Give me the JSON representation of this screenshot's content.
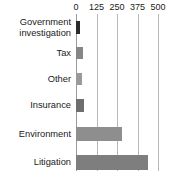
{
  "chart_data": {
    "type": "bar",
    "orientation": "horizontal",
    "title": "",
    "subtitle": "",
    "xlabel": "",
    "ylabel": "",
    "categories": [
      "Government\ninvestigation",
      "Tax",
      "Other",
      "Insurance",
      "Environment",
      "Litigation"
    ],
    "values": [
      25,
      42,
      38,
      48,
      280,
      442
    ],
    "xlim": [
      0,
      500
    ],
    "xticks": [
      0,
      125,
      250,
      375,
      500
    ],
    "xtick_labels": [
      "0",
      "125",
      "250",
      "375",
      "500"
    ],
    "grid": true,
    "grid_axis": "x",
    "legend": false,
    "bar_colors": [
      "#2b2b2b",
      "#868686",
      "#9a9a9a",
      "#6e6e6e",
      "#8e8e8e",
      "#7e7e7e"
    ],
    "background_color": "#ffffff",
    "text_color": "#1a1a1a",
    "gridline_color": "#b9b9b9"
  },
  "axis": {
    "ticks": [
      {
        "label": "0",
        "value": 0
      },
      {
        "label": "125",
        "value": 125
      },
      {
        "label": "250",
        "value": 250
      },
      {
        "label": "375",
        "value": 375
      },
      {
        "label": "500",
        "value": 500
      }
    ]
  },
  "rows": [
    {
      "label": "Government\ninvestigation",
      "value": 25,
      "color": "#2b2b2b"
    },
    {
      "label": "Tax",
      "value": 42,
      "color": "#868686"
    },
    {
      "label": "Other",
      "value": 38,
      "color": "#9a9a9a"
    },
    {
      "label": "Insurance",
      "value": 48,
      "color": "#6e6e6e"
    },
    {
      "label": "Environment",
      "value": 280,
      "color": "#8e8e8e"
    },
    {
      "label": "Litigation",
      "value": 442,
      "color": "#7e7e7e"
    }
  ]
}
